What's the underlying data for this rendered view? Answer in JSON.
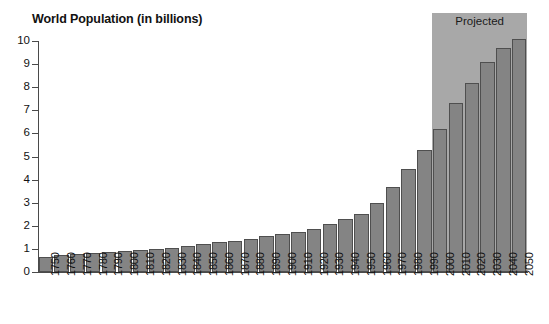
{
  "chart_data": {
    "type": "bar",
    "title": "World Population (in billions)",
    "xlabel": "",
    "ylabel": "",
    "ylim": [
      0,
      10
    ],
    "ytick_labels": [
      "10",
      "9",
      "8",
      "7",
      "6",
      "5",
      "4",
      "3",
      "2",
      "1",
      "0"
    ],
    "yticks": [
      10,
      9,
      8,
      7,
      6,
      5,
      4,
      3,
      2,
      1,
      0
    ],
    "grid": false,
    "legend": null,
    "categories": [
      "1750",
      "1760",
      "1770",
      "1780",
      "1790",
      "1800",
      "1810",
      "1820",
      "1830",
      "1840",
      "1850",
      "1860",
      "1870",
      "1880",
      "1890",
      "1900",
      "1910",
      "1920",
      "1930",
      "1940",
      "1950",
      "1960",
      "1970",
      "1980",
      "1990",
      "2000",
      "2010",
      "2020",
      "2030",
      "2040",
      "2050"
    ],
    "values": [
      0.65,
      0.72,
      0.78,
      0.82,
      0.88,
      0.92,
      0.96,
      1.0,
      1.06,
      1.12,
      1.2,
      1.28,
      1.36,
      1.45,
      1.55,
      1.65,
      1.75,
      1.86,
      2.07,
      2.3,
      2.5,
      3.0,
      3.7,
      4.45,
      5.3,
      6.2,
      7.3,
      8.2,
      9.1,
      9.7,
      10.1
    ],
    "annotations": [
      {
        "label": "Projected",
        "type": "shaded-region",
        "from_category": "2000",
        "to_category": "2050",
        "color": "#a8a8a8"
      }
    ],
    "colors": {
      "bar_fill": "#848484",
      "bar_border": "#4f4f4f",
      "axis": "#4a4a4a",
      "projected_band": "#a8a8a8",
      "background": "#ffffff",
      "text": "#111111"
    }
  }
}
